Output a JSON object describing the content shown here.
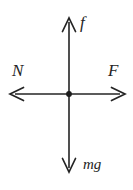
{
  "figure": {
    "type": "free-body-diagram",
    "width": 133,
    "height": 190,
    "background_color": "#ffffff",
    "stroke_color": "#242424",
    "title": ""
  },
  "origin": {
    "label": "origin-dot",
    "x": 69,
    "y": 94,
    "radius": 2.8,
    "fill": "#1c1c1c"
  },
  "vectors": [
    {
      "id": "friction",
      "label": "f",
      "direction": "up",
      "from_x": 69,
      "from_y": 94,
      "to_x": 69,
      "to_y": 18,
      "label_x": 86,
      "label_y": 25
    },
    {
      "id": "normal",
      "label": "N",
      "direction": "left",
      "from_x": 69,
      "from_y": 94,
      "to_x": 10,
      "to_y": 94,
      "label_x": 20,
      "label_y": 73
    },
    {
      "id": "applied",
      "label": "F",
      "direction": "right",
      "from_x": 69,
      "from_y": 94,
      "to_x": 125,
      "to_y": 94,
      "label_x": 116,
      "label_y": 73
    },
    {
      "id": "weight",
      "label": "mg",
      "direction": "down",
      "from_x": 69,
      "from_y": 94,
      "to_x": 69,
      "to_y": 172,
      "label_x": 96,
      "label_y": 167
    }
  ],
  "labels": {
    "friction": "f",
    "normal": "N",
    "applied": "F",
    "weight": "mg"
  }
}
